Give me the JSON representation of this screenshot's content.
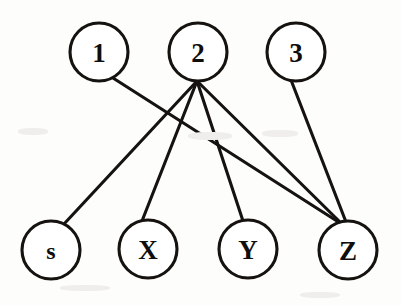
{
  "diagram": {
    "type": "bipartite-graph",
    "background_color": "#fdfdfc",
    "stroke_color": "#15120f",
    "node_fill_color": "#ffffff",
    "node_radius": 29,
    "edge_width": 3.1,
    "top_nodes": [
      {
        "id": "1",
        "label": "1",
        "cx": 99,
        "cy": 52,
        "r": 29
      },
      {
        "id": "2",
        "label": "2",
        "cx": 198,
        "cy": 52,
        "r": 29
      },
      {
        "id": "3",
        "label": "3",
        "cx": 296,
        "cy": 52,
        "r": 29
      }
    ],
    "bottom_nodes": [
      {
        "id": "s",
        "label": "s",
        "cx": 51,
        "cy": 250,
        "r": 29
      },
      {
        "id": "X",
        "label": "X",
        "cx": 148,
        "cy": 249,
        "r": 29
      },
      {
        "id": "Y",
        "label": "Y",
        "cx": 248,
        "cy": 249,
        "r": 29
      },
      {
        "id": "Z",
        "label": "Z",
        "cx": 348,
        "cy": 250,
        "r": 29
      }
    ],
    "edges": [
      {
        "from": "1",
        "to": "Z",
        "x1": 113,
        "y1": 78,
        "x2": 340,
        "y2": 223
      },
      {
        "from": "2",
        "to": "s",
        "x1": 197,
        "y1": 81,
        "x2": 64,
        "y2": 224
      },
      {
        "from": "2",
        "to": "X",
        "x1": 197,
        "y1": 81,
        "x2": 142,
        "y2": 221
      },
      {
        "from": "2",
        "to": "Y",
        "x1": 197,
        "y1": 81,
        "x2": 243,
        "y2": 221
      },
      {
        "from": "2",
        "to": "Z",
        "x1": 197,
        "y1": 81,
        "x2": 342,
        "y2": 224
      },
      {
        "from": "3",
        "to": "Z",
        "x1": 291,
        "y1": 80,
        "x2": 346,
        "y2": 222
      }
    ],
    "edge_count": 6,
    "node_count": 7
  }
}
